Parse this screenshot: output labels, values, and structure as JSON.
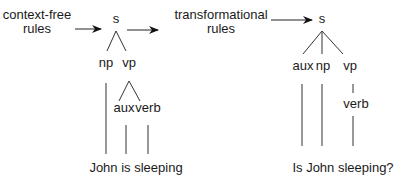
{
  "left": {
    "rules_label_line1": "context-free",
    "rules_label_line2": "rules",
    "tree": {
      "root": "s",
      "children": [
        "np",
        "vp"
      ],
      "vp_children": [
        "aux",
        "verb"
      ]
    },
    "sentence": "John is sleeping"
  },
  "right": {
    "rules_label_line1": "transformational",
    "rules_label_line2": "rules",
    "tree": {
      "root": "s",
      "children": [
        "aux",
        "np",
        "vp"
      ],
      "vp_children": [
        "verb"
      ]
    },
    "sentence": "Is John sleeping?"
  },
  "colors": {
    "ink": "#1a1a1a",
    "line": "#333333"
  }
}
